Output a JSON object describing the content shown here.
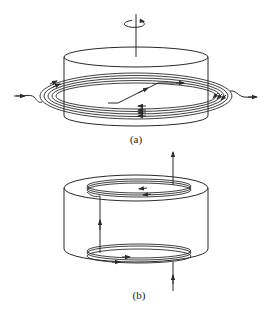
{
  "figure": {
    "panels": [
      {
        "id": "a",
        "caption": "(a)",
        "description": "Rotating cylinder with an axis of rotation and circular arrow on top; several concentric elliptical field lines wrap around the cylinder, entering from the left and exiting to the right, with a diagonal line crossing the top ellipse",
        "elements": [
          "rotation-axis",
          "rotation-arrow",
          "cylinder",
          "concentric-loops",
          "inlet-arrow",
          "outlet-arrow",
          "diagonal-crossing-line"
        ]
      },
      {
        "id": "b",
        "caption": "(b)",
        "description": "Short cylinder with helical coils at top and bottom rims; current enters from the bottom, spirals around the lower coil, rises vertically along the side, spirals around the upper coil, and exits upward",
        "elements": [
          "cylinder",
          "top-coil",
          "bottom-coil",
          "vertical-connector",
          "inlet-arrow-bottom",
          "outlet-arrow-top"
        ]
      }
    ],
    "colors": {
      "line": "#2a2a2a",
      "background": "#ffffff"
    }
  }
}
